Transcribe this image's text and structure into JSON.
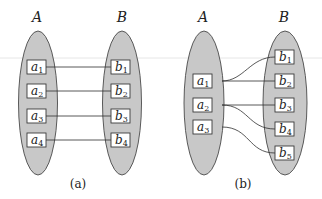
{
  "figure": {
    "panels": [
      {
        "id": "a",
        "caption": "(a)",
        "set_a_label": "A",
        "set_b_label": "B",
        "a_elements": [
          {
            "base": "a",
            "sub": "1"
          },
          {
            "base": "a",
            "sub": "2"
          },
          {
            "base": "a",
            "sub": "3"
          },
          {
            "base": "a",
            "sub": "4"
          }
        ],
        "b_elements": [
          {
            "base": "b",
            "sub": "1"
          },
          {
            "base": "b",
            "sub": "2"
          },
          {
            "base": "b",
            "sub": "3"
          },
          {
            "base": "b",
            "sub": "4"
          }
        ],
        "mappings": [
          {
            "from": "a1",
            "to": "b1",
            "style": "straight"
          },
          {
            "from": "a2",
            "to": "b2",
            "style": "straight"
          },
          {
            "from": "a3",
            "to": "b3",
            "style": "straight"
          },
          {
            "from": "a4",
            "to": "b4",
            "style": "straight"
          }
        ]
      },
      {
        "id": "b",
        "caption": "(b)",
        "set_a_label": "A",
        "set_b_label": "B",
        "a_elements": [
          {
            "base": "a",
            "sub": "1"
          },
          {
            "base": "a",
            "sub": "2"
          },
          {
            "base": "a",
            "sub": "3"
          }
        ],
        "b_elements": [
          {
            "base": "b",
            "sub": "1"
          },
          {
            "base": "b",
            "sub": "2"
          },
          {
            "base": "b",
            "sub": "3"
          },
          {
            "base": "b",
            "sub": "4"
          },
          {
            "base": "b",
            "sub": "5"
          }
        ],
        "mappings": [
          {
            "from": "a1",
            "to": "b1",
            "style": "curve"
          },
          {
            "from": "a1",
            "to": "b2",
            "style": "straight"
          },
          {
            "from": "a2",
            "to": "b3",
            "style": "straight"
          },
          {
            "from": "a2",
            "to": "b4",
            "style": "curve"
          },
          {
            "from": "a3",
            "to": "b5",
            "style": "curve"
          }
        ]
      }
    ]
  },
  "colors": {
    "set_fill": "#c8c8c8",
    "set_stroke": "#4a4a4a",
    "box_fill": "#ffffff",
    "line": "#2e2e2e"
  }
}
